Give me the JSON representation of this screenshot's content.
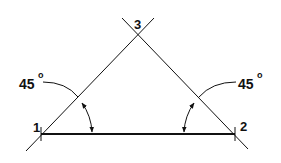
{
  "diagram": {
    "type": "geometric-construction",
    "colors": {
      "stroke": "#111111",
      "background": "#ffffff"
    },
    "points": [
      {
        "id": "1",
        "label": "1",
        "x": 41,
        "y": 134
      },
      {
        "id": "2",
        "label": "2",
        "x": 235,
        "y": 134
      },
      {
        "id": "3",
        "label": "3",
        "x": 138,
        "y": 34
      }
    ],
    "base_line": {
      "from": "1",
      "to": "2"
    },
    "angles": [
      {
        "at": "1",
        "value": "45",
        "unit": "o",
        "label_x": 20,
        "label_y": 86
      },
      {
        "at": "2",
        "value": "45",
        "unit": "o",
        "label_x": 238,
        "label_y": 86
      }
    ]
  }
}
